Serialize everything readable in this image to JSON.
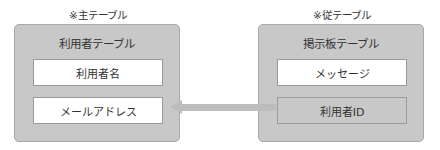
{
  "diagram": {
    "left": {
      "caption": "※主テーブル",
      "title": "利用者テーブル",
      "fields": [
        "利用者名",
        "メールアドレス"
      ]
    },
    "right": {
      "caption": "※従テーブル",
      "title": "掲示板テーブル",
      "fields": [
        "メッセージ",
        "利用者ID"
      ]
    },
    "relation": {
      "from": "利用者ID",
      "to": "メールアドレス",
      "direction": "right-to-left"
    }
  },
  "colors": {
    "table_fill": "#c8c8c8",
    "field_fill": "#ffffff",
    "arrow": "#bdbdbd",
    "border": "#9a9a9a"
  }
}
